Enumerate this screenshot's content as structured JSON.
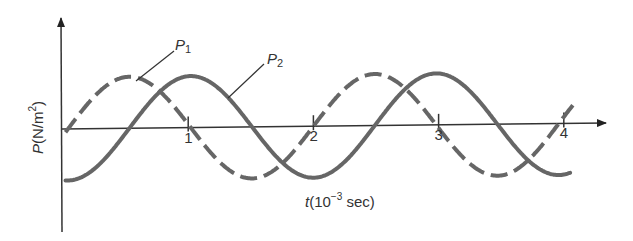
{
  "chart_data": {
    "type": "line",
    "title": "",
    "xlabel": {
      "var": "t",
      "unit_prefix": "(10",
      "exp": "−3",
      "unit_suffix": " sec)"
    },
    "ylabel": {
      "var": "P",
      "unit_prefix": "(N/m",
      "exp": "2",
      "unit_suffix": ")"
    },
    "x_ticks": [
      "1",
      "2",
      "3",
      "4"
    ],
    "xlim": [
      0,
      4.2
    ],
    "ylim": [
      -1,
      1
    ],
    "grid": false,
    "series": [
      {
        "name": "P1",
        "label_main": "P",
        "label_sub": "1",
        "style": "dashed",
        "function": "sin",
        "amplitude": 1,
        "period_ms": 1.96,
        "phase_ms": 0.04,
        "x_end": 4.1
      },
      {
        "name": "P2",
        "label_main": "P",
        "label_sub": "2",
        "style": "solid",
        "function": "-cos",
        "amplitude": 1,
        "period_ms": 1.96,
        "phase_ms": 0.04,
        "x_end": 4.05
      }
    ],
    "annotations": [
      {
        "text": "P1",
        "points_to": "P1 curve near first peak"
      },
      {
        "text": "P2",
        "points_to": "P2 curve after first peak"
      }
    ]
  },
  "layout": {
    "curve_color": "#666666",
    "axis_color": "#333333"
  }
}
